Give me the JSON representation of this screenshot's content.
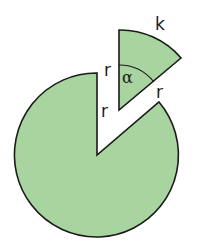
{
  "diagram": {
    "colors": {
      "fill": "#a8d4a0",
      "stroke": "#1a1a1a",
      "background": "#ffffff"
    },
    "labels": {
      "arc": "k",
      "angle": "α",
      "radius_sector_left": "r",
      "radius_sector_right": "r",
      "radius_circle_gap": "r"
    },
    "shapes": {
      "large_circle": {
        "center": [
          97,
          155
        ],
        "radius": 82,
        "gap_start": [
          97,
          73
        ],
        "gap_end": [
          159,
          102
        ]
      },
      "sector": {
        "apex": [
          119,
          110
        ],
        "top": [
          119,
          30
        ],
        "tip": [
          181,
          58
        ],
        "radius": 80
      }
    }
  }
}
